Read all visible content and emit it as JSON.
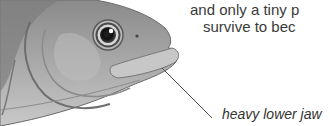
{
  "caption": {
    "line1": "and only a tiny p",
    "line2": "survive to bec"
  },
  "annotation": {
    "label": "heavy lower jaw"
  },
  "illustration": {
    "subject": "fish-head-illustration",
    "style": "grayscale pencil drawing"
  }
}
